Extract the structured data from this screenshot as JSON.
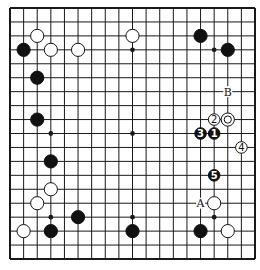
{
  "diagram": {
    "type": "go-board",
    "size": 19,
    "colors": {
      "line": "#1a1a1a",
      "black": "#111111",
      "white": "#ffffff",
      "background": "#ffffff"
    },
    "star_points": [
      [
        3,
        3
      ],
      [
        9,
        3
      ],
      [
        15,
        3
      ],
      [
        3,
        9
      ],
      [
        9,
        9
      ],
      [
        15,
        9
      ],
      [
        3,
        15
      ],
      [
        9,
        15
      ],
      [
        15,
        15
      ]
    ],
    "stones": [
      {
        "color": "white",
        "col": 2,
        "row": 2
      },
      {
        "color": "white",
        "col": 9,
        "row": 2
      },
      {
        "color": "black",
        "col": 14,
        "row": 2
      },
      {
        "color": "black",
        "col": 1,
        "row": 3
      },
      {
        "color": "white",
        "col": 3,
        "row": 3
      },
      {
        "color": "white",
        "col": 5,
        "row": 3
      },
      {
        "color": "black",
        "col": 16,
        "row": 3
      },
      {
        "color": "black",
        "col": 2,
        "row": 5
      },
      {
        "color": "black",
        "col": 2,
        "row": 8
      },
      {
        "color": "white",
        "col": 15,
        "row": 8,
        "label": "2"
      },
      {
        "color": "white",
        "col": 16,
        "row": 8,
        "marker": "circle"
      },
      {
        "color": "black",
        "col": 14,
        "row": 9,
        "label": "3"
      },
      {
        "color": "black",
        "col": 15,
        "row": 9,
        "label": "1"
      },
      {
        "color": "white",
        "col": 17,
        "row": 10,
        "label": "4"
      },
      {
        "color": "black",
        "col": 3,
        "row": 11
      },
      {
        "color": "black",
        "col": 15,
        "row": 12,
        "label": "5"
      },
      {
        "color": "white",
        "col": 3,
        "row": 13
      },
      {
        "color": "white",
        "col": 2,
        "row": 14
      },
      {
        "color": "white",
        "col": 15,
        "row": 14
      },
      {
        "color": "black",
        "col": 5,
        "row": 15
      },
      {
        "color": "white",
        "col": 1,
        "row": 16
      },
      {
        "color": "black",
        "col": 3,
        "row": 16
      },
      {
        "color": "black",
        "col": 9,
        "row": 16
      },
      {
        "color": "black",
        "col": 14,
        "row": 16
      },
      {
        "color": "white",
        "col": 16,
        "row": 16
      }
    ],
    "letters": [
      {
        "text": "B",
        "col": 16,
        "row": 6
      },
      {
        "text": "A",
        "col": 14,
        "row": 14
      }
    ]
  }
}
